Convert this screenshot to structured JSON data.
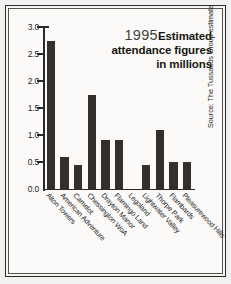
{
  "title": {
    "year": "1995",
    "line1_strong": "Estimated",
    "line2": "attendance figures",
    "line3": "in millions"
  },
  "source": "Source: The Tussauds Group estimate",
  "axis": {
    "y_ticks": [
      "3.0",
      "2.5",
      "2.0",
      "1.5",
      "1.0",
      "0.5",
      "0.0"
    ]
  },
  "colors": {
    "bar": "#332f2d",
    "axis": "#2b2a28",
    "paper": "#fbfaf8",
    "frame": "#2a2a28"
  },
  "chart_data": {
    "type": "bar",
    "xlabel": "",
    "ylabel": "",
    "ylim": [
      0.0,
      3.0
    ],
    "ytick_step": 0.5,
    "grid": false,
    "legend": "none",
    "annotation": "Source: The Tussauds Group estimate",
    "categories": [
      "Alton Towers",
      "American Adventure",
      "Camelot",
      "Chessington WoA",
      "Drayton Manor",
      "Flamingo Land",
      "Legoland",
      "Lightwater Valley",
      "Thorpe Park",
      "Flambards",
      "Pleasurewood Hills"
    ],
    "values": [
      2.75,
      0.6,
      0.45,
      1.75,
      0.9,
      0.9,
      0.0,
      0.45,
      1.1,
      0.5,
      0.5
    ]
  }
}
